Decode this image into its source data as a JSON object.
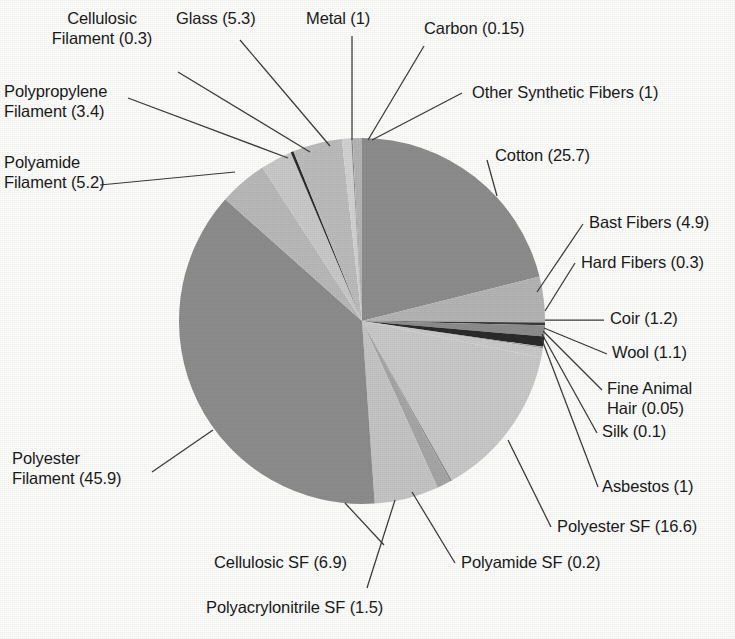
{
  "chart_data": {
    "type": "pie",
    "title": "",
    "subtitle": "",
    "xlabel": "",
    "ylabel": "",
    "legend_position": "none",
    "grid": false,
    "label_format": "name (value)",
    "total": 121.8,
    "start_angle_deg": 0,
    "direction": "clockwise",
    "categories": [
      "Cotton",
      "Bast Fibers",
      "Hard Fibers",
      "Coir",
      "Wool",
      "Fine Animal Hair",
      "Silk",
      "Asbestos",
      "Polyester SF",
      "Polyamide SF",
      "Polyacrylonitrile SF",
      "Cellulosic SF",
      "Polyester Filament",
      "Polyamide Filament",
      "Polypropylene Filament",
      "Cellulosic Filament",
      "Glass",
      "Metal",
      "Carbon",
      "Other Synthetic Fibers"
    ],
    "values": [
      25.7,
      4.9,
      0.3,
      1.2,
      1.1,
      0.05,
      0.1,
      1,
      16.6,
      0.2,
      1.5,
      6.9,
      45.9,
      5.2,
      3.4,
      0.3,
      5.3,
      1,
      0.15,
      1
    ],
    "colors": [
      "#8d8d8d",
      "#b5b5b5",
      "#3a3a3a",
      "#8d8d8d",
      "#2b2b2b",
      "#b5b5b5",
      "#8d8d8d",
      "#c9c9c9",
      "#c9c9c9",
      "#8d8d8d",
      "#a6a6a6",
      "#c5c5c5",
      "#8d8d8d",
      "#b9b9b9",
      "#c9c9c9",
      "#2b2b2b",
      "#bcbcbc",
      "#d2d2d2",
      "#8d8d8d",
      "#b5b5b5"
    ],
    "slices": [
      {
        "name": "Cotton",
        "value": 25.7,
        "label": "Cotton (25.7)",
        "color": "#8d8d8d"
      },
      {
        "name": "Bast Fibers",
        "value": 4.9,
        "label": "Bast Fibers (4.9)",
        "color": "#b5b5b5"
      },
      {
        "name": "Hard Fibers",
        "value": 0.3,
        "label": "Hard Fibers (0.3)",
        "color": "#3a3a3a"
      },
      {
        "name": "Coir",
        "value": 1.2,
        "label": "Coir (1.2)",
        "color": "#8d8d8d"
      },
      {
        "name": "Wool",
        "value": 1.1,
        "label": "Wool (1.1)",
        "color": "#2b2b2b"
      },
      {
        "name": "Fine Animal Hair",
        "value": 0.05,
        "label": "Fine Animal\nHair (0.05)",
        "color": "#b5b5b5"
      },
      {
        "name": "Silk",
        "value": 0.1,
        "label": "Silk (0.1)",
        "color": "#8d8d8d"
      },
      {
        "name": "Asbestos",
        "value": 1,
        "label": "Asbestos (1)",
        "color": "#c9c9c9"
      },
      {
        "name": "Polyester SF",
        "value": 16.6,
        "label": "Polyester SF (16.6)",
        "color": "#c9c9c9"
      },
      {
        "name": "Polyamide SF",
        "value": 0.2,
        "label": "Polyamide SF (0.2)",
        "color": "#8d8d8d"
      },
      {
        "name": "Polyacrylonitrile SF",
        "value": 1.5,
        "label": "Polyacrylonitrile SF (1.5)",
        "color": "#a6a6a6"
      },
      {
        "name": "Cellulosic SF",
        "value": 6.9,
        "label": "Cellulosic SF (6.9)",
        "color": "#c5c5c5"
      },
      {
        "name": "Polyester Filament",
        "value": 45.9,
        "label": "Polyester\nFilament (45.9)",
        "color": "#8d8d8d"
      },
      {
        "name": "Polyamide Filament",
        "value": 5.2,
        "label": "Polyamide\nFilament (5.2)",
        "color": "#b9b9b9"
      },
      {
        "name": "Polypropylene Filament",
        "value": 3.4,
        "label": "Polypropylene\nFilament (3.4)",
        "color": "#c9c9c9"
      },
      {
        "name": "Cellulosic Filament",
        "value": 0.3,
        "label": "Cellulosic\nFilament (0.3)",
        "color": "#2b2b2b"
      },
      {
        "name": "Glass",
        "value": 5.3,
        "label": "Glass (5.3)",
        "color": "#bcbcbc"
      },
      {
        "name": "Metal",
        "value": 1,
        "label": "Metal (1)",
        "color": "#d2d2d2"
      },
      {
        "name": "Carbon",
        "value": 0.15,
        "label": "Carbon (0.15)",
        "color": "#8d8d8d"
      },
      {
        "name": "Other Synthetic Fibers",
        "value": 1,
        "label": "Other Synthetic Fibers (1)",
        "color": "#b5b5b5"
      }
    ]
  },
  "labels": {
    "cellulosic_filament": "Cellulosic\nFilament (0.3)",
    "glass": "Glass (5.3)",
    "metal": "Metal (1)",
    "carbon": "Carbon (0.15)",
    "polypropylene_filament": "Polypropylene\nFilament (3.4)",
    "other_synthetic_fibers": "Other Synthetic Fibers (1)",
    "polyamide_filament": "Polyamide\nFilament (5.2)",
    "cotton": "Cotton (25.7)",
    "bast_fibers": "Bast Fibers (4.9)",
    "hard_fibers": "Hard Fibers (0.3)",
    "coir": "Coir (1.2)",
    "wool": "Wool (1.1)",
    "fine_animal_hair": "Fine Animal\nHair (0.05)",
    "silk": "Silk (0.1)",
    "asbestos": "Asbestos (1)",
    "polyester_sf": "Polyester SF (16.6)",
    "polyamide_sf": "Polyamide SF (0.2)",
    "polyacrylonitrile_sf": "Polyacrylonitrile SF (1.5)",
    "cellulosic_sf": "Cellulosic SF (6.9)",
    "polyester_filament": "Polyester\nFilament (45.9)"
  },
  "geometry": {
    "center_x": 362,
    "center_y": 321,
    "radius": 183
  },
  "style": {
    "background": "#fdfdfc",
    "text_color": "#1a1a1a",
    "leader_color": "#3a3a3a"
  }
}
